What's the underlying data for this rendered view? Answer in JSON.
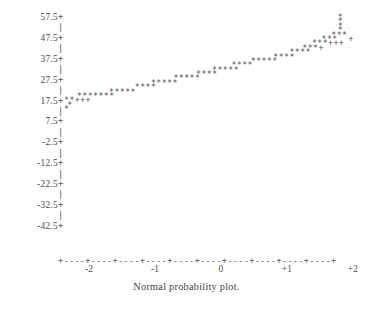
{
  "figure": {
    "caption": "Normal probability plot.",
    "mark_symbol": "*",
    "overplot_symbol": "+",
    "tick_symbol": "+",
    "connector_symbol": "|",
    "axis_fill": "-",
    "ink_color": "#4d4d4d",
    "background_color": "#ffffff"
  },
  "chart_data": {
    "type": "scatter",
    "title": "",
    "subtitle": "",
    "caption": "Normal probability plot.",
    "xlabel": "",
    "ylabel": "",
    "xlim": [
      -2.6,
      2.6
    ],
    "ylim": [
      -45.5,
      60.0
    ],
    "grid": false,
    "legend": null,
    "x_ticks": [
      -2,
      -1,
      0,
      1,
      2
    ],
    "x_ticklabels": [
      "-2",
      "-1",
      "0",
      "+1",
      "+2"
    ],
    "y_ticks": [
      57.5,
      47.5,
      37.5,
      27.5,
      17.5,
      7.5,
      -2.5,
      -12.5,
      -22.5,
      -32.5,
      -42.5
    ],
    "y_ticklabels": [
      "57.5",
      "47.5",
      "37.5",
      "27.5",
      "17.5",
      "7.5",
      "-2.5",
      "-12.5",
      "-22.5",
      "-32.5",
      "-42.5"
    ],
    "rows": [
      {
        "y": 57.5,
        "pad": 85,
        "marks": "*"
      },
      {
        "y": 55.4,
        "pad": 85,
        "marks": "*"
      },
      {
        "y": 53.3,
        "pad": 85,
        "marks": "*"
      },
      {
        "y": 51.2,
        "pad": 85,
        "marks": "*"
      },
      {
        "y": 49.1,
        "pad": 83,
        "marks": "***"
      },
      {
        "y": 47.0,
        "pad": 80,
        "marks": "***  +"
      },
      {
        "y": 44.9,
        "pad": 77,
        "marks": "***+++"
      },
      {
        "y": 42.8,
        "pad": 74,
        "marks": "***+"
      },
      {
        "y": 40.7,
        "pad": 70,
        "marks": "****"
      },
      {
        "y": 38.6,
        "pad": 65,
        "marks": "****"
      },
      {
        "y": 36.5,
        "pad": 58,
        "marks": "*****"
      },
      {
        "y": 34.4,
        "pad": 52,
        "marks": "****"
      },
      {
        "y": 32.3,
        "pad": 46,
        "marks": "*****"
      },
      {
        "y": 30.2,
        "pad": 41,
        "marks": "****"
      },
      {
        "y": 28.1,
        "pad": 34,
        "marks": "*****"
      },
      {
        "y": 26.0,
        "pad": 27,
        "marks": "*****"
      },
      {
        "y": 23.9,
        "pad": 22,
        "marks": "****"
      },
      {
        "y": 21.8,
        "pad": 14,
        "marks": "*****"
      },
      {
        "y": 19.7,
        "pad": 4,
        "marks": "*******"
      },
      {
        "y": 17.6,
        "pad": 0,
        "marks": "**+++"
      },
      {
        "y": 15.5,
        "pad": 1,
        "marks": "*"
      },
      {
        "y": 13.4,
        "pad": 0,
        "marks": "*"
      }
    ],
    "marker_counts_by_row": [
      1,
      1,
      1,
      1,
      3,
      4,
      6,
      4,
      4,
      4,
      5,
      4,
      5,
      4,
      5,
      5,
      4,
      5,
      7,
      5,
      1,
      1
    ],
    "total_points": 75
  },
  "axis": {
    "x_axis_line": "+----+----+----+----+----+----+----+----+----+----+",
    "x_tick_positions_px": [
      31,
      97,
      163,
      229,
      295
    ]
  },
  "y_rows": [
    {
      "label": "57.5",
      "tick": "+"
    },
    {
      "label": "",
      "tick": "|"
    },
    {
      "label": "47.5",
      "tick": "+"
    },
    {
      "label": "",
      "tick": "|"
    },
    {
      "label": "37.5",
      "tick": "+"
    },
    {
      "label": "",
      "tick": "|"
    },
    {
      "label": "27.5",
      "tick": "+"
    },
    {
      "label": "",
      "tick": "|"
    },
    {
      "label": "17.5",
      "tick": "+"
    },
    {
      "label": "",
      "tick": "|"
    },
    {
      "label": "7.5",
      "tick": "+"
    },
    {
      "label": "",
      "tick": "|"
    },
    {
      "label": "-2.5",
      "tick": "+"
    },
    {
      "label": "",
      "tick": "|"
    },
    {
      "label": "-12.5",
      "tick": "+"
    },
    {
      "label": "",
      "tick": "|"
    },
    {
      "label": "-22.5",
      "tick": "+"
    },
    {
      "label": "",
      "tick": "|"
    },
    {
      "label": "-32.5",
      "tick": "+"
    },
    {
      "label": "",
      "tick": "|"
    },
    {
      "label": "-42.5",
      "tick": "+"
    }
  ]
}
